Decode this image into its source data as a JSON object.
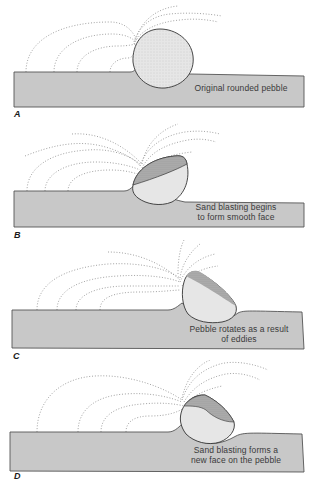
{
  "figure": {
    "colors": {
      "ground_fill": "#c8c8c8",
      "ground_stroke": "#555555",
      "pebble_fill": "#e6e6e6",
      "pebble_face_fill": "#b4b4b4",
      "pebble_stroke": "#333333",
      "wind_dots": "#8a8a8a",
      "text": "#3a3a3a"
    },
    "panels": [
      {
        "label": "A",
        "caption_lines": [
          "Original rounded pebble"
        ]
      },
      {
        "label": "B",
        "caption_lines": [
          "Sand blasting begins",
          "to form smooth face"
        ]
      },
      {
        "label": "C",
        "caption_lines": [
          "Pebble rotates as a result",
          "of eddies"
        ]
      },
      {
        "label": "D",
        "caption_lines": [
          "Sand blasting forms a",
          "new face on the pebble"
        ]
      }
    ]
  }
}
